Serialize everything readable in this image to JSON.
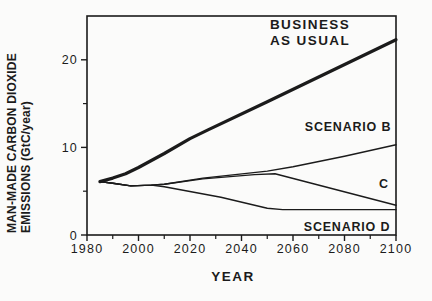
{
  "figure": {
    "background": "#fbfbfa",
    "ink": "#1b1b1b"
  },
  "chart_data": {
    "type": "line",
    "title": "",
    "xlabel": "YEAR",
    "ylabel_line1": "MAN-MADE CARBON DIOXIDE",
    "ylabel_line2": "EMISSIONS (GtC/year)",
    "xlim": [
      1980,
      2100
    ],
    "ylim": [
      0,
      25
    ],
    "x_major_ticks": [
      1980,
      2000,
      2020,
      2040,
      2060,
      2080,
      2100
    ],
    "x_minor_ticks": [
      1990,
      2010,
      2030,
      2050,
      2070,
      2090
    ],
    "y_major_ticks": [
      0,
      10,
      20
    ],
    "y_minor_ticks": [
      5,
      15
    ],
    "grid": false,
    "frame": true,
    "legend_position": "inline-annotations",
    "series": [
      {
        "name": "business-as-usual",
        "label": "BUSINESS AS USUAL",
        "line_width": 3.2,
        "points": [
          [
            1985,
            6.1
          ],
          [
            1990,
            6.5
          ],
          [
            1995,
            7.0
          ],
          [
            2000,
            7.7
          ],
          [
            2010,
            9.3
          ],
          [
            2020,
            11.0
          ],
          [
            2027,
            12.0
          ],
          [
            2050,
            15.2
          ],
          [
            2100,
            22.3
          ]
        ]
      },
      {
        "name": "scenario-b",
        "label": "SCENARIO B",
        "line_width": 1.4,
        "points": [
          [
            1985,
            6.1
          ],
          [
            1990,
            5.9
          ],
          [
            1997,
            5.6
          ],
          [
            2005,
            5.7
          ],
          [
            2010,
            5.8
          ],
          [
            2025,
            6.5
          ],
          [
            2050,
            7.3
          ],
          [
            2060,
            7.8
          ],
          [
            2080,
            9.0
          ],
          [
            2100,
            10.3
          ]
        ]
      },
      {
        "name": "scenario-c",
        "label": "C",
        "line_width": 1.4,
        "points": [
          [
            1985,
            6.1
          ],
          [
            1990,
            5.9
          ],
          [
            1997,
            5.6
          ],
          [
            2005,
            5.7
          ],
          [
            2010,
            5.8
          ],
          [
            2025,
            6.4
          ],
          [
            2045,
            6.9
          ],
          [
            2053,
            7.0
          ],
          [
            2100,
            3.4
          ]
        ]
      },
      {
        "name": "scenario-d",
        "label": "SCENARIO D",
        "line_width": 1.4,
        "points": [
          [
            1985,
            6.1
          ],
          [
            1990,
            5.9
          ],
          [
            1997,
            5.6
          ],
          [
            2005,
            5.7
          ],
          [
            2010,
            5.5
          ],
          [
            2032,
            4.3
          ],
          [
            2050,
            3.05
          ],
          [
            2056,
            2.9
          ],
          [
            2100,
            2.9
          ]
        ]
      }
    ],
    "annotations": {
      "business_as_usual": {
        "line1": "BUSINESS",
        "line2": "AS USUAL"
      },
      "scenario_b": "SCENARIO B",
      "scenario_c": "C",
      "scenario_d": "SCENARIO D"
    }
  }
}
